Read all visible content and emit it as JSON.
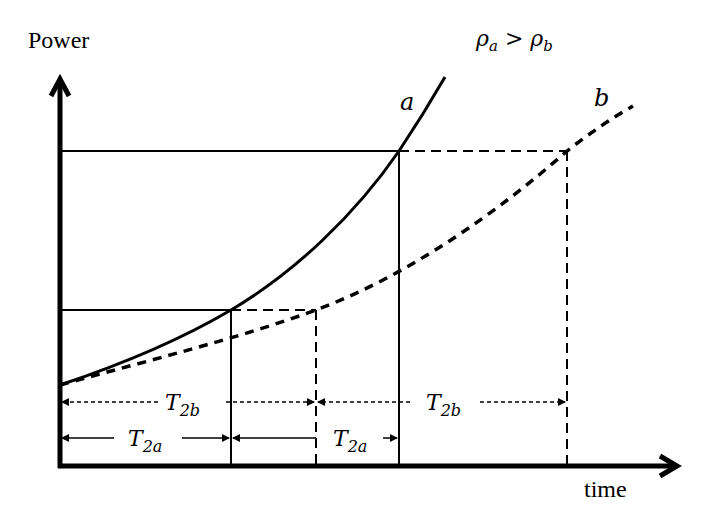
{
  "axes": {
    "y_label": "Power",
    "x_label": "time"
  },
  "condition": {
    "lhs": "ρ",
    "lhs_sub": "a",
    "op": ">",
    "rhs": "ρ",
    "rhs_sub": "b"
  },
  "curves": {
    "a": {
      "label": "a",
      "style": "solid"
    },
    "b": {
      "label": "b",
      "style": "dashed"
    }
  },
  "intervals": {
    "t2b": {
      "main": "T",
      "sub": "2b"
    },
    "t2a": {
      "main": "T",
      "sub": "2a"
    }
  },
  "colors": {
    "ink": "#000000",
    "background": "#ffffff"
  }
}
